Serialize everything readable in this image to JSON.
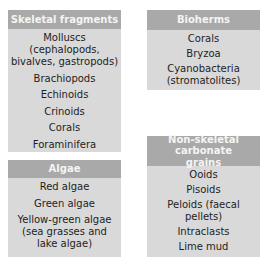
{
  "boxes": {
    "skeletal": {
      "title": "Skeletal fragments",
      "items": [
        "Molluscs (cephalopods, bivalves, gastropods)",
        "Brachiopods",
        "Echinoids",
        "Crinoids",
        "Corals",
        "Foraminifera"
      ]
    },
    "algae": {
      "title": "Algae",
      "items": [
        "Red algae",
        "Green algae",
        "Yellow-green algae (sea grasses and lake algae)"
      ]
    },
    "bioherms": {
      "title": "Bioherms",
      "items": [
        "Corals",
        "Bryzoa",
        "Cyanobacteria (stromatolites)"
      ]
    },
    "nonskeletal": {
      "title": "Non-skeletal carbonate grains",
      "items": [
        "Ooids",
        "Pisoids",
        "Peloids (faecal pellets)",
        "Intraclasts",
        "Lime mud"
      ]
    }
  },
  "colors": {
    "header": "#a9a9a9",
    "body": "#d9d9d9",
    "header_text": "#f4f4f4",
    "item_text": "#1e1e1e"
  }
}
